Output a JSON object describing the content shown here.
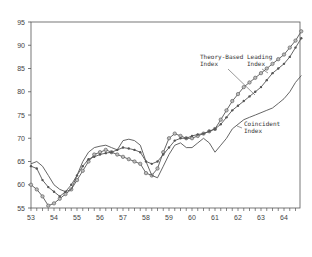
{
  "chart_data": {
    "type": "line",
    "title": "",
    "xlabel": "",
    "ylabel": "",
    "xlim": [
      53,
      64.75
    ],
    "ylim": [
      55,
      95
    ],
    "x_ticks": [
      "53",
      "54",
      "55",
      "56",
      "57",
      "58",
      "59",
      "60",
      "61",
      "62",
      "63",
      "64"
    ],
    "y_ticks": [
      "55",
      "60",
      "65",
      "70",
      "75",
      "80",
      "85",
      "90",
      "95"
    ],
    "grid": false,
    "legend": "annotations",
    "annotations": [
      {
        "text": [
          "Theory-Based",
          "Index"
        ],
        "series": "Theory-Based Index"
      },
      {
        "text": [
          "Leading",
          "Index"
        ],
        "series": "Leading Index"
      },
      {
        "text": [
          "Coincident",
          "Index"
        ],
        "series": "Coincident Index"
      }
    ],
    "series": [
      {
        "name": "Theory-Based Index",
        "marker": "circle",
        "x": [
          53,
          53.25,
          53.5,
          53.75,
          54,
          54.25,
          54.5,
          54.75,
          55,
          55.25,
          55.5,
          55.75,
          56,
          56.25,
          56.5,
          56.75,
          57,
          57.25,
          57.5,
          57.75,
          58,
          58.25,
          58.5,
          58.75,
          59,
          59.25,
          59.5,
          59.75,
          60,
          60.25,
          60.5,
          60.75,
          61,
          61.25,
          61.5,
          61.75,
          62,
          62.25,
          62.5,
          62.75,
          63,
          63.25,
          63.5,
          63.75,
          64,
          64.25,
          64.5,
          64.75
        ],
        "y": [
          60,
          59,
          57.5,
          55.5,
          56,
          57,
          58,
          59,
          61,
          63,
          65,
          66.5,
          67,
          67.5,
          67,
          66.5,
          66,
          65.5,
          65,
          64.5,
          62.5,
          62,
          63.5,
          67,
          70,
          71,
          70.5,
          70,
          70,
          70.5,
          71,
          71.5,
          72,
          74,
          76,
          78,
          79.5,
          81,
          82,
          83,
          84,
          85,
          86,
          87,
          88,
          89.5,
          91,
          93
        ]
      },
      {
        "name": "Leading Index",
        "marker": "dot",
        "x": [
          53,
          53.25,
          53.5,
          53.75,
          54,
          54.25,
          54.5,
          54.75,
          55,
          55.25,
          55.5,
          55.75,
          56,
          56.25,
          56.5,
          56.75,
          57,
          57.25,
          57.5,
          57.75,
          58,
          58.25,
          58.5,
          58.75,
          59,
          59.25,
          59.5,
          59.75,
          60,
          60.25,
          60.5,
          60.75,
          61,
          61.25,
          61.5,
          61.75,
          62,
          62.25,
          62.5,
          62.75,
          63,
          63.25,
          63.5,
          63.75,
          64,
          64.25,
          64.5,
          64.75
        ],
        "y": [
          64,
          63.5,
          61,
          59.5,
          58.5,
          57.5,
          58.5,
          60,
          62,
          64,
          65.5,
          66,
          66.5,
          66.8,
          67,
          67.5,
          68,
          67.8,
          67.5,
          67,
          65,
          64.5,
          65,
          66.5,
          68,
          69.5,
          70,
          70,
          70.5,
          70.8,
          71,
          71.5,
          72,
          73,
          74.5,
          76,
          77,
          78,
          79,
          80,
          81,
          82.5,
          84,
          85,
          86,
          87.5,
          89.5,
          91.5
        ]
      },
      {
        "name": "Coincident Index",
        "marker": "none",
        "x": [
          53,
          53.25,
          53.5,
          53.75,
          54,
          54.25,
          54.5,
          54.75,
          55,
          55.25,
          55.5,
          55.75,
          56,
          56.25,
          56.5,
          56.75,
          57,
          57.25,
          57.5,
          57.75,
          58,
          58.25,
          58.5,
          58.75,
          59,
          59.25,
          59.5,
          59.75,
          60,
          60.25,
          60.5,
          60.75,
          61,
          61.25,
          61.5,
          61.75,
          62,
          62.25,
          62.5,
          62.75,
          63,
          63.25,
          63.5,
          63.75,
          64,
          64.25,
          64.5,
          64.75
        ],
        "y": [
          64.5,
          65,
          64,
          62,
          60,
          59,
          58.5,
          59,
          62,
          65,
          67,
          68,
          68.3,
          68.5,
          68,
          67.5,
          69.5,
          69.8,
          69.5,
          68.5,
          65,
          62,
          61.5,
          64,
          66.5,
          68.5,
          69,
          68,
          68,
          69,
          70,
          69,
          67,
          68.5,
          70,
          72,
          73,
          74,
          74.5,
          75,
          75.5,
          76,
          76.5,
          77.5,
          78.5,
          80,
          82,
          83.5
        ]
      }
    ]
  }
}
